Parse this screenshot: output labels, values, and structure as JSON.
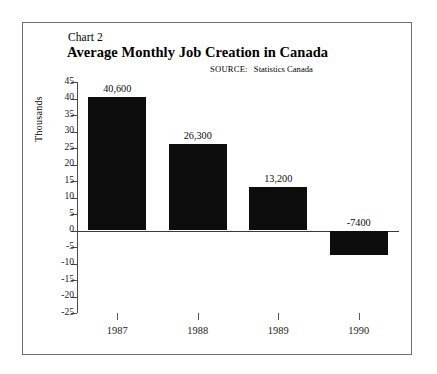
{
  "figure": {
    "chart_number_label": "Chart 2",
    "title": "Average Monthly Job Creation in Canada",
    "source_prefix": "SOURCE:",
    "source_value": "Statistics Canada"
  },
  "chart_data": {
    "type": "bar",
    "title": "Average Monthly Job Creation in Canada",
    "subtitle": "Chart 2",
    "annotations": [
      "SOURCE: Statistics Canada"
    ],
    "xlabel": "",
    "ylabel": "Thousands",
    "categories": [
      "1987",
      "1988",
      "1989",
      "1990"
    ],
    "values": [
      40.6,
      26.3,
      13.2,
      -7.4
    ],
    "value_labels": [
      "40,600",
      "26,300",
      "13,200",
      "-7400"
    ],
    "ylim": [
      -25,
      45
    ],
    "yticks": [
      45,
      40,
      35,
      30,
      25,
      20,
      15,
      10,
      5,
      0,
      -5,
      -10,
      -15,
      -20,
      -25
    ],
    "ytick_labels": [
      "45",
      "40",
      "35",
      "30",
      "25",
      "20",
      "15",
      "10",
      "5",
      "0",
      "-5",
      "-10",
      "-15",
      "-20",
      "-25"
    ],
    "grid": false,
    "legend": null,
    "bar_color": "#0d0d0d",
    "axis_color": "#4a4a4a",
    "units": "thousands of jobs per month"
  }
}
